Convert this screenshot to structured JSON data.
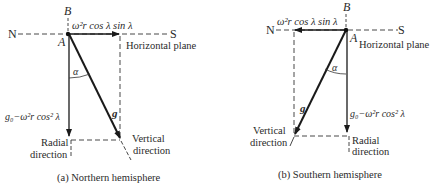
{
  "panels": [
    {
      "id": "a",
      "caption": "(a)  Northern hemisphere",
      "point_label": "A",
      "top_label": "B",
      "left_end": "N",
      "right_end": "S",
      "horizontal_plane": "Horizontal plane",
      "horizontal_component": "ω²r cos λ sin λ",
      "radial_component": "g₀−ω²r cos² λ",
      "vector_g": "g",
      "angle": "α",
      "radial_line1": "Radial",
      "radial_line2": "direction",
      "vertical_line1": "Vertical",
      "vertical_line2": "direction"
    },
    {
      "id": "b",
      "caption": "(b)  Southern hemisphere",
      "point_label": "A",
      "top_label": "B",
      "left_end": "N",
      "right_end": "S",
      "horizontal_plane": "Horizontal plane",
      "horizontal_component": "ω²r cos λ sin λ",
      "radial_component": "g₀−ω²r cos² λ",
      "vector_g": "g",
      "angle": "α",
      "radial_line1": "Radial",
      "radial_line2": "direction",
      "vertical_line1": "Vertical",
      "vertical_line2": "direction"
    }
  ]
}
